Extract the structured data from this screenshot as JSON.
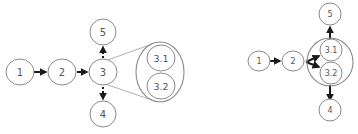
{
  "left_diagram": {
    "nodes": {
      "n1": "1",
      "n2": "2",
      "n3": "3",
      "n4": "4",
      "n5": "5",
      "n31": "3.1",
      "n32": "3.2"
    },
    "edges": [
      {
        "from": "1",
        "to": "2",
        "style": "solid"
      },
      {
        "from": "2",
        "to": "3",
        "style": "solid"
      },
      {
        "from": "3",
        "to": "5",
        "style": "dotted"
      },
      {
        "from": "3",
        "to": "4",
        "style": "dotted"
      }
    ],
    "expansion": {
      "of": "3",
      "children": [
        "3.1",
        "3.2"
      ]
    }
  },
  "right_diagram": {
    "nodes": {
      "n1": "1",
      "n2": "2",
      "n4": "4",
      "n5": "5",
      "n31": "3.1",
      "n32": "3.2"
    },
    "edges": [
      {
        "from": "1",
        "to": "2",
        "style": "solid"
      },
      {
        "from": "2",
        "to": "3.1",
        "style": "solid"
      },
      {
        "from": "2",
        "to": "3.2",
        "style": "solid"
      },
      {
        "from": "3",
        "to": "5",
        "style": "solid"
      },
      {
        "from": "3",
        "to": "4",
        "style": "solid"
      }
    ],
    "group": {
      "label": "3",
      "children": [
        "3.1",
        "3.2"
      ]
    }
  },
  "colors": {
    "node_stroke": "#8a8a8a",
    "edge": "#1a1a1a",
    "label": "#555555"
  }
}
